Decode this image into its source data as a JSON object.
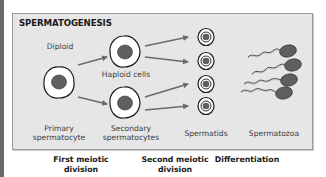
{
  "diagram": {
    "title": "SPERMATOGENESIS",
    "colors": {
      "panel_bg": "#e6e6e6",
      "panel_border": "#9a9a9a",
      "nucleus": "#5f5f5f",
      "arrow": "#6b6b6b",
      "cell_outline": "#1a1a1a"
    },
    "stages": [
      {
        "name": "Primary spermatocyte",
        "line1": "Primary",
        "line2": "spermatocyte",
        "ploidy_label": "Diploid",
        "count": 1
      },
      {
        "name": "Secondary spermatocytes",
        "line1": "Secondary",
        "line2": "spermatocytes",
        "ploidy_label": "Haploid cells",
        "count": 2
      },
      {
        "name": "Spermatids",
        "line1": "Spermatids",
        "count": 4
      },
      {
        "name": "Spermatozoa",
        "line1": "Spermatozoa",
        "count": 4
      }
    ],
    "processes": [
      {
        "line1": "First meiotic",
        "line2": "division"
      },
      {
        "line1": "Second meiotic",
        "line2": "division"
      },
      {
        "line1": "Differentiation",
        "line2": ""
      }
    ]
  }
}
